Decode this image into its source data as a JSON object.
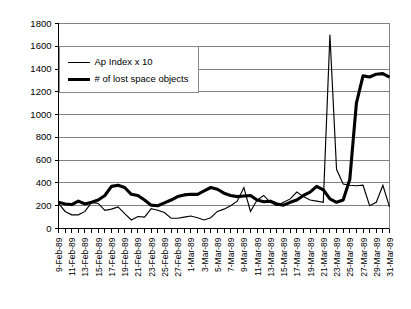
{
  "chart_data": {
    "type": "line",
    "title": "",
    "xlabel": "",
    "ylabel": "",
    "ylim": [
      0,
      1800
    ],
    "ytick_step": 200,
    "yticks": [
      0,
      200,
      400,
      600,
      800,
      1000,
      1200,
      1400,
      1600,
      1800
    ],
    "grid": true,
    "legend_position": "upper-left-inside",
    "x": [
      "9-Feb-89",
      "10-Feb-89",
      "11-Feb-89",
      "12-Feb-89",
      "13-Feb-89",
      "14-Feb-89",
      "15-Feb-89",
      "16-Feb-89",
      "17-Feb-89",
      "18-Feb-89",
      "19-Feb-89",
      "20-Feb-89",
      "21-Feb-89",
      "22-Feb-89",
      "23-Feb-89",
      "24-Feb-89",
      "25-Feb-89",
      "26-Feb-89",
      "27-Feb-89",
      "28-Feb-89",
      "1-Mar-89",
      "2-Mar-89",
      "3-Mar-89",
      "4-Mar-89",
      "5-Mar-89",
      "6-Mar-89",
      "7-Mar-89",
      "8-Mar-89",
      "9-Mar-89",
      "10-Mar-89",
      "11-Mar-89",
      "12-Mar-89",
      "13-Mar-89",
      "14-Mar-89",
      "15-Mar-89",
      "16-Mar-89",
      "17-Mar-89",
      "18-Mar-89",
      "19-Mar-89",
      "20-Mar-89",
      "21-Mar-89",
      "22-Mar-89",
      "23-Mar-89",
      "24-Mar-89",
      "25-Mar-89",
      "26-Mar-89",
      "27-Mar-89",
      "28-Mar-89",
      "29-Mar-89",
      "30-Mar-89",
      "31-Mar-89"
    ],
    "xtick_labels": [
      "9-Feb-89",
      "11-Feb-89",
      "13-Feb-89",
      "15-Feb-89",
      "17-Feb-89",
      "19-Feb-89",
      "21-Feb-89",
      "23-Feb-89",
      "25-Feb-89",
      "27-Feb-89",
      "1-Mar-89",
      "3-Mar-89",
      "5-Mar-89",
      "7-Mar-89",
      "9-Mar-89",
      "11-Mar-89",
      "13-Mar-89",
      "15-Mar-89",
      "17-Mar-89",
      "19-Mar-89",
      "21-Mar-89",
      "23-Mar-89",
      "25-Mar-89",
      "27-Mar-89",
      "29-Mar-89",
      "31-Mar-89"
    ],
    "xtick_label_every": 2,
    "series": [
      {
        "name": "Ap Index x 10",
        "style": "thin",
        "color": "#000000",
        "values": [
          220,
          150,
          120,
          120,
          150,
          230,
          220,
          160,
          170,
          190,
          130,
          75,
          105,
          100,
          175,
          160,
          140,
          90,
          90,
          100,
          110,
          95,
          75,
          95,
          150,
          170,
          200,
          240,
          360,
          150,
          250,
          290,
          230,
          200,
          230,
          260,
          320,
          280,
          250,
          240,
          230,
          1700,
          520,
          390,
          380,
          375,
          380,
          200,
          230,
          380,
          190
        ]
      },
      {
        "name": "# of lost space objects",
        "style": "thick",
        "color": "#000000",
        "values": [
          230,
          215,
          210,
          240,
          215,
          230,
          250,
          290,
          370,
          380,
          360,
          300,
          290,
          250,
          205,
          200,
          225,
          250,
          280,
          295,
          300,
          300,
          330,
          360,
          345,
          310,
          290,
          280,
          285,
          290,
          250,
          235,
          240,
          215,
          205,
          230,
          250,
          290,
          320,
          370,
          340,
          260,
          230,
          250,
          430,
          1100,
          1340,
          1330,
          1355,
          1360,
          1330
        ]
      }
    ],
    "series_thick_tail": {
      "note": "continuation values beyond index 50 for thick series",
      "values": [
        1200,
        1170,
        1135,
        1130,
        930,
        350,
        330,
        320,
        300,
        255,
        270,
        340,
        320,
        300,
        290,
        270,
        250
      ]
    },
    "legend": [
      {
        "label": "Ap Index x 10",
        "style": "thin"
      },
      {
        "label": "# of lost space objects",
        "style": "thick"
      }
    ]
  },
  "axis": {
    "y_max_label": "1800",
    "y_min_label": "0"
  }
}
